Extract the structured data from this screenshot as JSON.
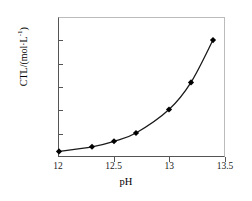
{
  "chart_data": {
    "type": "line",
    "title": "",
    "xlabel": "pH",
    "ylabel": "CTL/(mol·L⁻¹)",
    "ylabel_main": "CTL/(mol·L",
    "ylabel_exp": "-1",
    "ylabel_tail": ")",
    "xlim": [
      12,
      13.5
    ],
    "ylim": [
      0,
      0.03
    ],
    "grid": false,
    "legend": null,
    "marker": "diamond",
    "line_color": "#1a1a1a",
    "marker_color": "#000000",
    "x": [
      12,
      12.3,
      12.5,
      12.7,
      13,
      13.2,
      13.4
    ],
    "values": [
      0.001,
      0.002,
      0.0032,
      0.005,
      0.0101,
      0.016,
      0.0252
    ],
    "xticks": [
      "12",
      "12.5",
      "13",
      "13.5"
    ],
    "xtick_values": [
      12,
      12.5,
      13,
      13.5
    ],
    "yticks": [
      "0",
      "0.005",
      "0.01",
      "0.015",
      "0.02",
      "0.025",
      "0.03"
    ],
    "ytick_values": [
      0,
      0.005,
      0.01,
      0.015,
      0.02,
      0.025,
      0.03
    ]
  },
  "caption": {
    "partial_text": ""
  }
}
